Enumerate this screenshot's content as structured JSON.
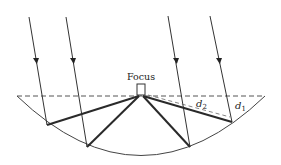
{
  "diagram": {
    "focus_label": "Focus",
    "d1_label": "d",
    "d1_sub": "1",
    "d2_label": "d",
    "d2_sub": "2",
    "colors": {
      "line": "#333333",
      "thick": "#2a2a2a",
      "dashed": "#555555",
      "background": "#ffffff"
    },
    "rays": [
      {
        "name": "ray-1",
        "top": [
          29,
          17
        ],
        "hit": [
          47,
          125
        ],
        "arrow_y": 60
      },
      {
        "name": "ray-2",
        "top": [
          66,
          17
        ],
        "hit": [
          87,
          147
        ],
        "arrow_y": 60
      },
      {
        "name": "ray-3",
        "top": [
          168,
          16
        ],
        "hit": [
          190,
          147
        ],
        "arrow_y": 60
      },
      {
        "name": "ray-4",
        "top": [
          210,
          16
        ],
        "hit": [
          232,
          122
        ],
        "arrow_y": 60
      }
    ],
    "focus_point": [
      141,
      96
    ],
    "aperture_line": {
      "x1": 17,
      "x2": 265,
      "y": 96
    }
  }
}
